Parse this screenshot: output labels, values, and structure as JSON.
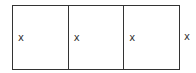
{
  "diagram": {
    "cells": [
      {
        "label": "x"
      },
      {
        "label": "x"
      },
      {
        "label": "x"
      }
    ],
    "outside_label": "x"
  }
}
